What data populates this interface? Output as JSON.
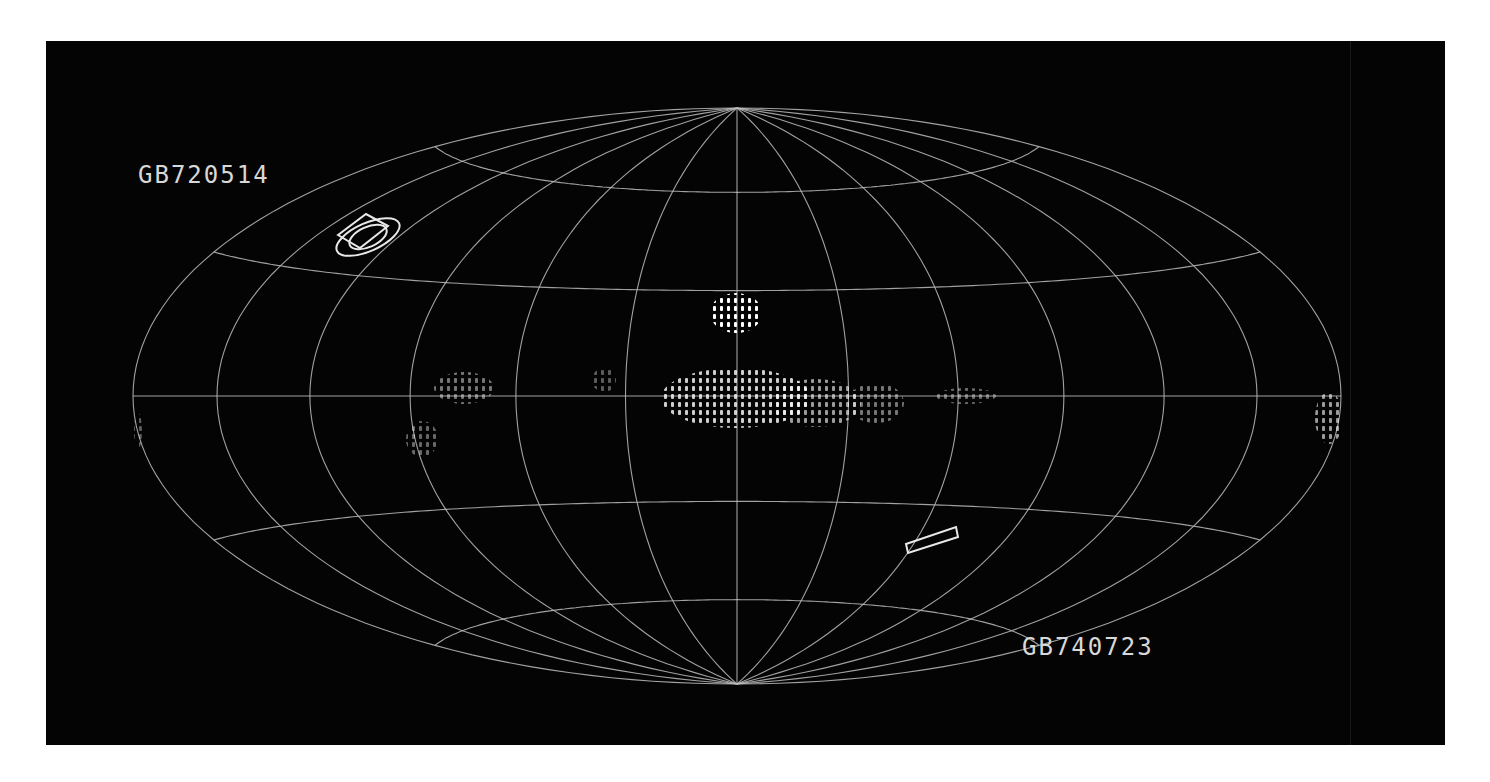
{
  "chart_data": {
    "type": "heatmap",
    "projection": "hammer-aitoff",
    "title": "",
    "background": "#040404",
    "grid": true,
    "grid_color": "#bdbdbd",
    "graticule": {
      "meridian_step_deg": 30,
      "parallels_deg": [
        -60,
        -30,
        0,
        30,
        60
      ]
    },
    "ellipse_px": {
      "cx": 691,
      "cy": 355,
      "a": 604,
      "b": 288
    },
    "labels": [
      {
        "text": "GB720514",
        "x": 92,
        "y": 120
      },
      {
        "text": "GB740723",
        "x": 976,
        "y": 592
      }
    ],
    "error_boxes": [
      {
        "name": "GB720514",
        "shapes": [
          {
            "kind": "ellipse",
            "cx": 322,
            "cy": 196,
            "rx": 34,
            "ry": 14,
            "rot": -24
          },
          {
            "kind": "ellipse",
            "cx": 322,
            "cy": 196,
            "rx": 20,
            "ry": 10,
            "rot": -24
          },
          {
            "kind": "parallelogram",
            "points": "292,194 320,173 342,185 314,207"
          }
        ]
      },
      {
        "name": "GB740723",
        "shapes": [
          {
            "kind": "parallelogram",
            "points": "860,503 910,486 912,496 862,512"
          }
        ]
      }
    ],
    "emission_regions": [
      {
        "name": "north-bright-spot",
        "cx": 690,
        "cy": 272,
        "rx": 26,
        "ry": 20,
        "intensity": 1.0
      },
      {
        "name": "galactic-center-west",
        "cx": 690,
        "cy": 357,
        "rx": 75,
        "ry": 30,
        "intensity": 0.8
      },
      {
        "name": "galactic-center-east",
        "cx": 770,
        "cy": 362,
        "rx": 45,
        "ry": 24,
        "intensity": 0.6
      },
      {
        "name": "galactic-plane-east-1",
        "cx": 830,
        "cy": 362,
        "rx": 28,
        "ry": 20,
        "intensity": 0.45
      },
      {
        "name": "galactic-plane-east-2",
        "cx": 920,
        "cy": 355,
        "rx": 30,
        "ry": 8,
        "intensity": 0.4
      },
      {
        "name": "galactic-plane-west-1",
        "cx": 418,
        "cy": 347,
        "rx": 30,
        "ry": 16,
        "intensity": 0.45
      },
      {
        "name": "galactic-plane-west-2",
        "cx": 558,
        "cy": 339,
        "rx": 12,
        "ry": 12,
        "intensity": 0.35
      },
      {
        "name": "galactic-plane-south-west",
        "cx": 376,
        "cy": 398,
        "rx": 16,
        "ry": 18,
        "intensity": 0.4
      },
      {
        "name": "anticenter-east-edge",
        "cx": 1283,
        "cy": 377,
        "rx": 14,
        "ry": 26,
        "intensity": 0.6
      },
      {
        "name": "anticenter-west-edge",
        "cx": 92,
        "cy": 390,
        "rx": 4,
        "ry": 18,
        "intensity": 0.35
      }
    ]
  }
}
